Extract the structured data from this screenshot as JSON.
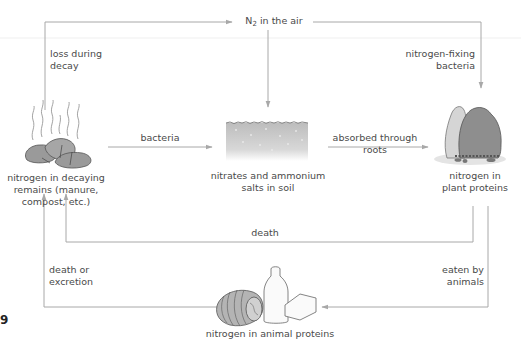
{
  "diagram": {
    "nodes": {
      "air": {
        "label_prefix": "N",
        "label_sub": "2",
        "label_suffix": " in the air"
      },
      "decaying": {
        "line1": "nitrogen in decaying",
        "line2": "remains (manure,",
        "line3": "compost, etc.)"
      },
      "soil": {
        "line1": "nitrates and ammonium",
        "line2": "salts in soil"
      },
      "plant": {
        "line1": "nitrogen in",
        "line2": "plant proteins"
      },
      "animal": {
        "line1": "nitrogen in animal proteins"
      }
    },
    "edges": {
      "loss": {
        "line1": "loss during",
        "line2": "decay"
      },
      "fixing": {
        "line1": "nitrogen-fixing",
        "line2": "bacteria"
      },
      "bacteria": {
        "line1": "bacteria"
      },
      "absorbed": {
        "line1": "absorbed through",
        "line2": "roots"
      },
      "death": {
        "line1": "death"
      },
      "death_excretion": {
        "line1": "death or",
        "line2": "excretion"
      },
      "eaten": {
        "line1": "eaten by",
        "line2": "animals"
      }
    },
    "figure_number": "9",
    "colors": {
      "arrow": "#a8a8a8",
      "text": "#4a4a4a",
      "soil": "#c8c8c8",
      "illustration": "#8a8a8a"
    }
  }
}
